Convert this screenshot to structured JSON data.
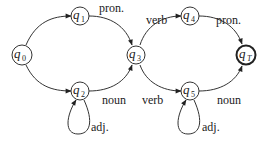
{
  "diagram": {
    "type": "finite-state-automaton",
    "nodes": [
      {
        "id": "q0",
        "base": "q",
        "sub": "0",
        "final": false
      },
      {
        "id": "q1",
        "base": "q",
        "sub": "1",
        "final": false
      },
      {
        "id": "q2",
        "base": "q",
        "sub": "2",
        "final": false
      },
      {
        "id": "q3",
        "base": "q",
        "sub": "3",
        "final": false
      },
      {
        "id": "q4",
        "base": "q",
        "sub": "4",
        "final": false
      },
      {
        "id": "q5",
        "base": "q",
        "sub": "5",
        "final": false
      },
      {
        "id": "qT",
        "base": "q",
        "sub": "T",
        "final": true
      }
    ],
    "edges": [
      {
        "from": "q0",
        "to": "q1",
        "label": ""
      },
      {
        "from": "q0",
        "to": "q2",
        "label": ""
      },
      {
        "from": "q1",
        "to": "q3",
        "label": "pron."
      },
      {
        "from": "q2",
        "to": "q3",
        "label": "noun"
      },
      {
        "from": "q2",
        "to": "q2",
        "label": "adj."
      },
      {
        "from": "q3",
        "to": "q4",
        "label": "verb"
      },
      {
        "from": "q3",
        "to": "q5",
        "label": "verb"
      },
      {
        "from": "q4",
        "to": "qT",
        "label": "pron."
      },
      {
        "from": "q5",
        "to": "qT",
        "label": "noun"
      },
      {
        "from": "q5",
        "to": "q5",
        "label": "adj."
      }
    ]
  }
}
